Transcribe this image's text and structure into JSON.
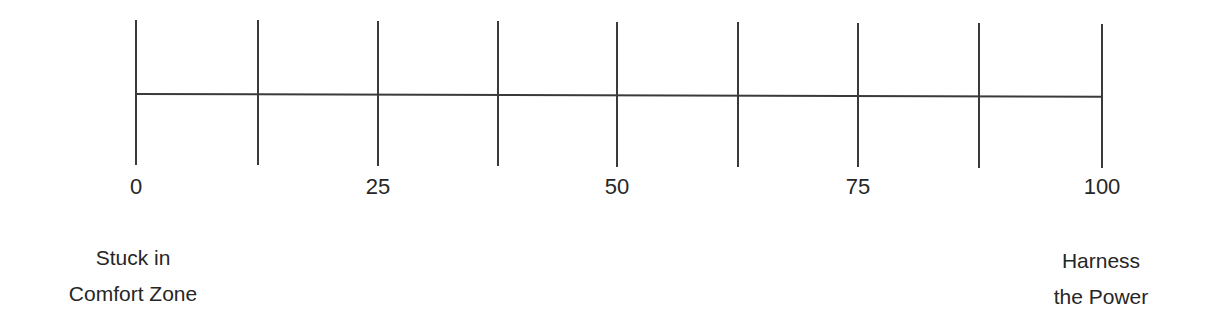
{
  "scale": {
    "ticks": [
      {
        "x": 136,
        "top": 20,
        "bottom": 165
      },
      {
        "x": 258,
        "top": 20,
        "bottom": 165
      },
      {
        "x": 378,
        "top": 21,
        "bottom": 166
      },
      {
        "x": 498,
        "top": 21,
        "bottom": 166
      },
      {
        "x": 617,
        "top": 22,
        "bottom": 167
      },
      {
        "x": 738,
        "top": 22,
        "bottom": 167
      },
      {
        "x": 858,
        "top": 23,
        "bottom": 167
      },
      {
        "x": 979,
        "top": 23,
        "bottom": 168
      },
      {
        "x": 1102,
        "top": 24,
        "bottom": 168
      }
    ],
    "labels": [
      {
        "text": "0",
        "x": 136
      },
      {
        "text": "25",
        "x": 378
      },
      {
        "text": "50",
        "x": 617
      },
      {
        "text": "75",
        "x": 858
      },
      {
        "text": "100",
        "x": 1102
      }
    ],
    "left_anchor": {
      "line1": "Stuck in",
      "line2": "Comfort Zone"
    },
    "right_anchor": {
      "line1": "Harness",
      "line2": "the Power"
    },
    "line_color": "#3a3a3a",
    "text_color": "#262626"
  }
}
